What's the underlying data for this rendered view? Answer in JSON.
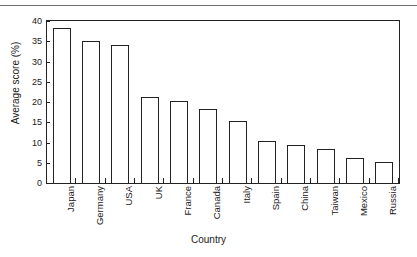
{
  "figure": {
    "separator": "top-horizontal-rule"
  },
  "chart_data": {
    "type": "bar",
    "title": "",
    "xlabel": "Country",
    "ylabel": "Average score (%)",
    "categories": [
      "Japan",
      "Germany",
      "USA",
      "UK",
      "France",
      "Canada",
      "Italy",
      "Spain",
      "China",
      "Taiwan",
      "Mexico",
      "Russia"
    ],
    "values": [
      38.2,
      35.1,
      34.2,
      21.2,
      20.3,
      18.3,
      15.3,
      10.4,
      9.5,
      8.4,
      6.2,
      5.2
    ],
    "ylim": [
      0,
      40
    ],
    "yticks": [
      0,
      5,
      10,
      15,
      20,
      25,
      30,
      35,
      40
    ],
    "ytick_labels": [
      "0",
      "5",
      "10",
      "15",
      "20",
      "25",
      "30",
      "35",
      "40"
    ],
    "grid": false,
    "legend": null,
    "bar_fill": "#ffffff",
    "bar_edge": "#222222",
    "axis_color": "#222222",
    "background": "#ffffff"
  }
}
